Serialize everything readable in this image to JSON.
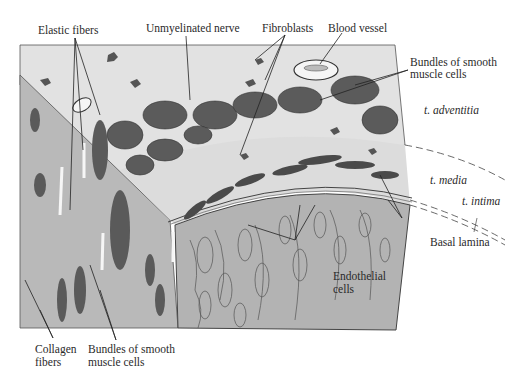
{
  "figure": {
    "labels": {
      "elastic_fibers": "Elastic fibers",
      "unmyelinated_nerve": "Unmyelinated nerve",
      "fibroblasts": "Fibroblasts",
      "blood_vessel": "Blood vessel",
      "bundles_smooth_muscle_top_1": "Bundles of smooth",
      "bundles_smooth_muscle_top_2": "muscle cells",
      "t_adventitia": "t. adventitia",
      "t_media": "t. media",
      "t_intima": "t. intima",
      "basal_lamina": "Basal lamina",
      "endothelial_1": "Endothelial",
      "endothelial_2": "cells",
      "collagen_1": "Collagen",
      "collagen_2": "fibers",
      "bundles_smooth_muscle_bottom_1": "Bundles of smooth",
      "bundles_smooth_muscle_bottom_2": "muscle cells"
    },
    "colors": {
      "background": "#ffffff",
      "top_face": "#e4e4e4",
      "left_face": "#b8b8b8",
      "intima_face": "#b4b4b4",
      "bundle_fill": "#5a5a5a",
      "ink": "#2a2a2a"
    }
  }
}
